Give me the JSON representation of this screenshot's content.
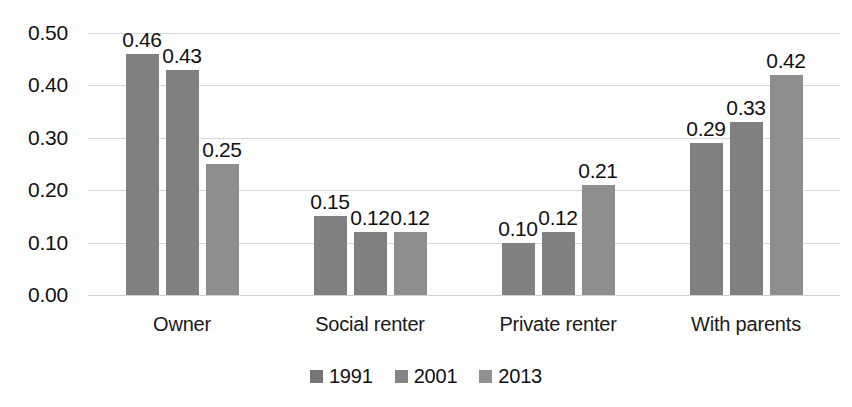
{
  "chart_data": {
    "type": "bar",
    "title": "",
    "subtitle": "",
    "xlabel": "",
    "ylabel": "",
    "categories": [
      "Owner",
      "Social renter",
      "Private renter",
      "With parents"
    ],
    "series": [
      {
        "name": "1991",
        "values": [
          0.46,
          0.15,
          0.1,
          0.29
        ],
        "color": "#808080"
      },
      {
        "name": "2001",
        "values": [
          0.43,
          0.12,
          0.12,
          0.33
        ],
        "color": "#7f8080"
      },
      {
        "name": "2013",
        "values": [
          0.25,
          0.12,
          0.21,
          0.42
        ],
        "color": "#8e8e8e"
      }
    ],
    "data_labels": [
      [
        "0.46",
        "0.43",
        "0.25"
      ],
      [
        "0.15",
        "0.12",
        "0.12"
      ],
      [
        "0.10",
        "0.12",
        "0.21"
      ],
      [
        "0.29",
        "0.33",
        "0.42"
      ]
    ],
    "ylim": [
      0.0,
      0.5
    ],
    "ytick_labels": [
      "0.00",
      "0.10",
      "0.20",
      "0.30",
      "0.40",
      "0.50"
    ],
    "ytick_values": [
      0.0,
      0.1,
      0.2,
      0.3,
      0.4,
      0.5
    ],
    "grid": true,
    "grid_color": "#d9d9d9",
    "legend_position": "bottom",
    "legend_entries": [
      "1991",
      "2001",
      "2013"
    ],
    "background": "#ffffff"
  }
}
